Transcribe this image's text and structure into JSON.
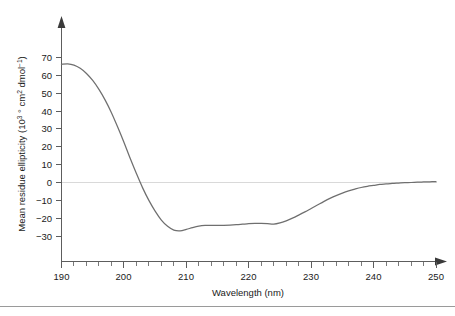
{
  "figure": {
    "background_color": "#ffffff",
    "curve_color": "#6f6f6f",
    "axis_color": "#5d5d5d",
    "zero_line_color": "#d9d9d9"
  },
  "chart_data": {
    "type": "line",
    "title": "",
    "xlabel": "Wavelength (nm)",
    "ylabel_parts": {
      "main": "Mean residue ellipticity (10",
      "exp1": "3",
      "mid": " ° cm",
      "exp2": "2",
      "tail": " dmol",
      "exp3": "−1",
      "close": ")"
    },
    "ylabel_plain": "Mean residue ellipticity (10³ ° cm² dmol⁻¹)",
    "xlim": [
      190,
      250
    ],
    "ylim": [
      -37,
      75
    ],
    "xticks": [
      190,
      200,
      210,
      220,
      230,
      240,
      250
    ],
    "xtick_labels": [
      "190",
      "200",
      "210",
      "220",
      "230",
      "240",
      "250"
    ],
    "x_minor_step": 2,
    "yticks": [
      70,
      60,
      50,
      40,
      30,
      20,
      10,
      0,
      -10,
      -20,
      -30
    ],
    "ytick_labels": [
      "70",
      "60",
      "50",
      "40",
      "30",
      "20",
      "10",
      "0",
      "−10",
      "−20",
      "−30"
    ],
    "grid": false,
    "legend": null,
    "zero_reference_line": 0,
    "x": [
      190,
      191,
      192,
      193,
      194,
      195,
      196,
      197,
      198,
      199,
      200,
      201,
      202,
      203,
      204,
      205,
      206,
      207,
      208,
      209,
      210,
      211,
      212,
      213,
      214,
      215,
      216,
      217,
      218,
      219,
      220,
      221,
      222,
      223,
      224,
      225,
      226,
      227,
      228,
      229,
      230,
      231,
      232,
      233,
      234,
      235,
      236,
      237,
      238,
      239,
      240,
      241,
      242,
      243,
      244,
      245,
      246,
      247,
      248,
      249,
      250
    ],
    "values": [
      66.0,
      66.3,
      65.6,
      63.8,
      60.9,
      57.0,
      52.0,
      46.0,
      39.0,
      31.0,
      22.5,
      13.5,
      5.0,
      -3.0,
      -10.0,
      -16.0,
      -21.0,
      -24.5,
      -26.6,
      -27.0,
      -26.2,
      -25.2,
      -24.4,
      -24.0,
      -23.9,
      -23.9,
      -23.9,
      -23.8,
      -23.6,
      -23.3,
      -23.0,
      -22.8,
      -22.8,
      -23.0,
      -23.3,
      -22.6,
      -21.4,
      -19.9,
      -18.2,
      -16.4,
      -14.5,
      -12.6,
      -10.7,
      -8.9,
      -7.3,
      -5.9,
      -4.7,
      -3.7,
      -2.8,
      -2.1,
      -1.6,
      -1.1,
      -0.8,
      -0.5,
      -0.3,
      -0.1,
      0.0,
      0.2,
      0.3,
      0.4,
      0.5
    ],
    "annotations": {
      "peak_positive_nm": 191,
      "peak_positive_value": 66.3,
      "zero_crossing_nm": 202.6,
      "minimum_1_nm": 209,
      "minimum_1_value": -27.0,
      "minimum_2_nm": 222,
      "minimum_2_value": -22.8
    }
  }
}
